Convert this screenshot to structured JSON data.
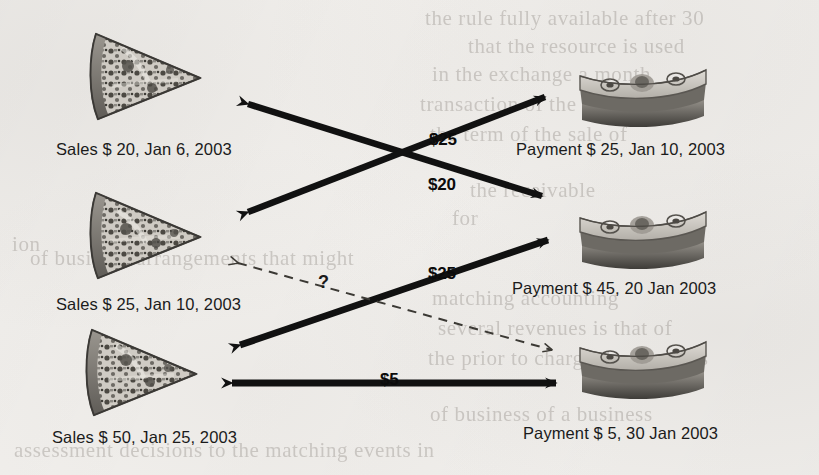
{
  "diagram": {
    "background_color": "#f3f1ee",
    "ink_color": "#111111",
    "sales_nodes": [
      {
        "id": "sales-20",
        "icon": "pizza-slice-icon",
        "label": "Sales $ 20, Jan 6, 2003",
        "amount": 20,
        "date": "Jan 6, 2003"
      },
      {
        "id": "sales-25",
        "icon": "pizza-slice-icon",
        "label": "Sales $ 25, Jan 10, 2003",
        "amount": 25,
        "date": "Jan 10, 2003"
      },
      {
        "id": "sales-50",
        "icon": "pizza-slice-icon",
        "label": "Sales $ 50, Jan 25, 2003",
        "amount": 50,
        "date": "Jan 25, 2003"
      }
    ],
    "payment_nodes": [
      {
        "id": "payment-25",
        "icon": "money-stack-icon",
        "label": "Payment $ 25, Jan 10, 2003",
        "amount": 25,
        "date": "Jan 10, 2003"
      },
      {
        "id": "payment-45",
        "icon": "money-stack-icon",
        "label": "Payment $ 45, 20 Jan 2003",
        "amount": 45,
        "date": "20 Jan 2003"
      },
      {
        "id": "payment-5",
        "icon": "money-stack-icon",
        "label": "Payment $ 5, 30 Jan 2003",
        "amount": 5,
        "date": "30 Jan 2003"
      }
    ],
    "links": [
      {
        "id": "link-25-top",
        "label": "$25",
        "style": "solid",
        "heads": "both",
        "from": "sales-20",
        "to": "payment-25"
      },
      {
        "id": "link-20",
        "label": "$20",
        "style": "solid",
        "heads": "both",
        "from": "sales-25",
        "to": "payment-45"
      },
      {
        "id": "link-25-middle",
        "label": "$25",
        "style": "solid",
        "heads": "both",
        "from": "sales-50",
        "to": "payment-45"
      },
      {
        "id": "link-unknown",
        "label": "?",
        "style": "dashed",
        "heads": "both",
        "from": "sales-25",
        "to": "payment-5"
      },
      {
        "id": "link-5",
        "label": "$5",
        "style": "solid",
        "heads": "both",
        "from": "sales-50",
        "to": "payment-5"
      }
    ]
  },
  "ghost_text": {
    "lines": [
      "the rule fully available after 30",
      "that the resource is used",
      "in the exchange a month",
      "transaction of the service and",
      "the term of the sale of",
      "the receivable",
      "for",
      "ion",
      "of business arrangements that might",
      "matching accounting",
      "several revenues is that of",
      "the prior to charge the earnings",
      "of business of a business",
      "assessment decisions to the matching events in"
    ]
  }
}
